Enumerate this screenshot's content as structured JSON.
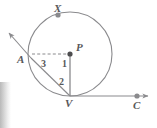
{
  "figure": {
    "background_color": "#ffffff",
    "stroke_color": "#8a8a8d",
    "label_color": "#58585a",
    "point_fill": "#8a8a8d"
  },
  "circle": {
    "center_label": "P",
    "center": {
      "x": 70,
      "y": 54
    },
    "radius": 42
  },
  "points": [
    {
      "name": "X",
      "label": "X",
      "x": 58,
      "y": 15,
      "label_dx": -1,
      "label_dy": -13,
      "marker": true
    },
    {
      "name": "P",
      "label": "P",
      "x": 70,
      "y": 54,
      "label_dx": 5,
      "label_dy": -12,
      "marker": true
    },
    {
      "name": "A",
      "label": "A",
      "x": 31,
      "y": 58,
      "label_dx": -12,
      "label_dy": 0,
      "marker": false
    },
    {
      "name": "V",
      "label": "V",
      "x": 70,
      "y": 96,
      "label_dx": -3,
      "label_dy": 4,
      "marker": false
    },
    {
      "name": "C",
      "label": "C",
      "x": 137,
      "y": 96,
      "label_dx": -3,
      "label_dy": 5,
      "marker": true
    }
  ],
  "angles": [
    {
      "name": "angle-3",
      "label": "3",
      "x": 44,
      "y": 64
    },
    {
      "name": "angle-1",
      "label": "1",
      "x": 64,
      "y": 64
    },
    {
      "name": "angle-2",
      "label": "2",
      "x": 62,
      "y": 82
    }
  ],
  "segments": {
    "radius_pv": {
      "from": "P",
      "to": "V",
      "style": "solid"
    },
    "dashed_ap": {
      "from": "A",
      "to": "P",
      "style": "dashed"
    },
    "chord_av": {
      "from": "A",
      "to": "V",
      "style": "solid"
    },
    "secant_ray": {
      "from": "A",
      "to": "arrow-upper-left",
      "style": "solid",
      "arrow": true
    },
    "tangent_ray": {
      "from": "V",
      "to": "arrow-right",
      "style": "solid",
      "arrow": true
    }
  },
  "rays": {
    "upper_left_tip": {
      "x": 4,
      "y": 30
    },
    "right_tip": {
      "x": 152,
      "y": 96
    }
  }
}
